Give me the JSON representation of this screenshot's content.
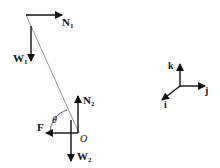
{
  "diagram": {
    "type": "free-body-diagram",
    "colors": {
      "stroke": "#111111",
      "rod": "#888888",
      "background": "#ffffff"
    },
    "top_end": {
      "normal_force": {
        "label": "N",
        "sub": "1"
      },
      "weight": {
        "label": "W",
        "sub": "1"
      }
    },
    "bottom_end": {
      "normal_force": {
        "label": "N",
        "sub": "2"
      },
      "weight": {
        "label": "W",
        "sub": "2"
      },
      "friction": {
        "label": "F"
      },
      "angle": {
        "label": "θ"
      },
      "point": {
        "label": "O"
      }
    },
    "axes": {
      "k": {
        "label": "k"
      },
      "j": {
        "label": "j"
      },
      "i": {
        "label": "i"
      }
    }
  }
}
